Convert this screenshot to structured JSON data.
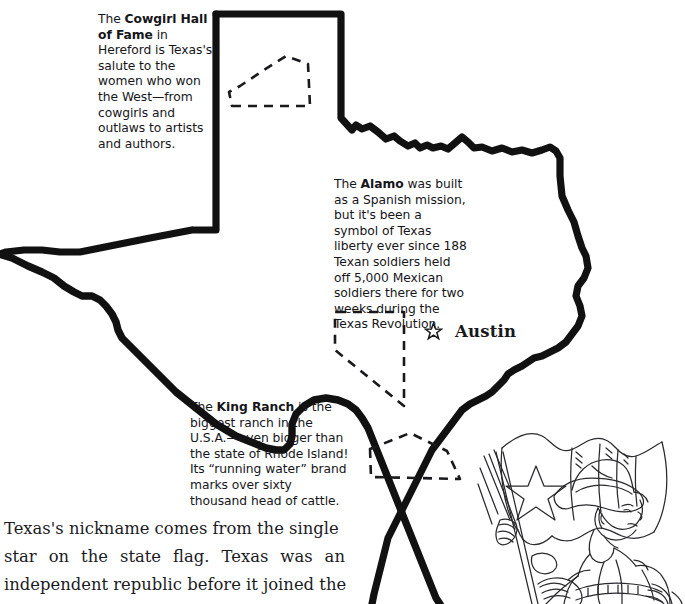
{
  "page": {
    "background_color": "#ffffff",
    "ink_color": "#16161a"
  },
  "map": {
    "name": "texas-outline",
    "style": "heavy hand-drawn black outline",
    "stroke_color": "#111111",
    "capital": {
      "name": "Austin",
      "marker": "star-outline"
    },
    "comparison_shapes": [
      {
        "name": "rhode-island-outline",
        "style": "dashed"
      },
      {
        "name": "nevada-outline",
        "style": "dashed"
      },
      {
        "name": "delaware-outline",
        "style": "dashed"
      }
    ]
  },
  "notes": [
    {
      "id": "cowgirl-hall-of-fame",
      "lead": "The ",
      "bold": "Cowgirl Hall of Fame",
      "rest": " in Hereford is Texas's salute to the women who won the West—from cowgirls and outlaws to artists and authors."
    },
    {
      "id": "alamo",
      "lead": "The ",
      "bold": "Alamo",
      "rest": " was built as a Spanish mission, but it's been a symbol of Texas liberty ever since 188 Texan soldiers held off 5,000 Mexican soldiers there for two weeks during the Texas Revolution."
    },
    {
      "id": "king-ranch",
      "lead": "The ",
      "bold": "King Ranch",
      "rest": " is the biggest ranch in the U.S.A.—even bigger than the state of Rhode Island! Its “running water” brand marks over sixty thousand head of cattle."
    }
  ],
  "body_copy": {
    "line1": "Texas's nickname comes from the single",
    "line2_words": [
      "star",
      "on",
      "the",
      "state",
      "flag.",
      "Texas",
      "was",
      "an"
    ],
    "line3": "independent republic before it joined the"
  },
  "illustration": {
    "name": "cowboy-with-texas-flag",
    "description": "Line drawing of a cowboy in hat and jacket holding the Texas lone-star flag"
  }
}
